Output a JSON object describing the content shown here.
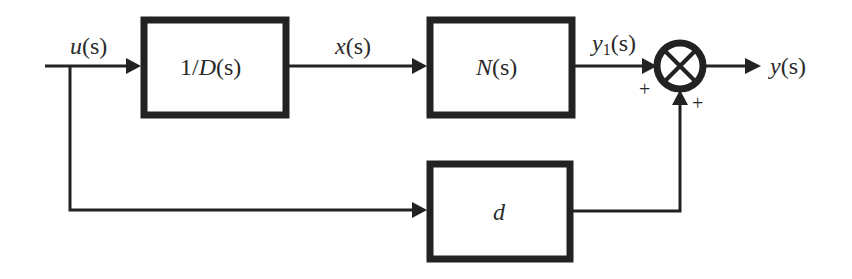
{
  "diagram": {
    "type": "block-diagram",
    "signals": {
      "input": {
        "name": "u",
        "arg": "(s)"
      },
      "intermediate": {
        "name": "x",
        "arg": "(s)"
      },
      "branch_output": {
        "name": "y",
        "sub": "1",
        "arg": "(s)"
      },
      "output": {
        "name": "y",
        "arg": "(s)"
      }
    },
    "blocks": [
      {
        "id": "inverse-d",
        "pre": "1/",
        "name": "D",
        "arg": "(s)"
      },
      {
        "id": "numerator",
        "name": "N",
        "arg": "(s)"
      },
      {
        "id": "feedthrough",
        "name": "d"
      }
    ],
    "summing_junction": {
      "symbol": "⊗",
      "signs": {
        "left": "+",
        "bottom": "+"
      }
    },
    "colors": {
      "stroke": "#222222",
      "text": "#2a2a2a",
      "background": "#ffffff"
    }
  }
}
